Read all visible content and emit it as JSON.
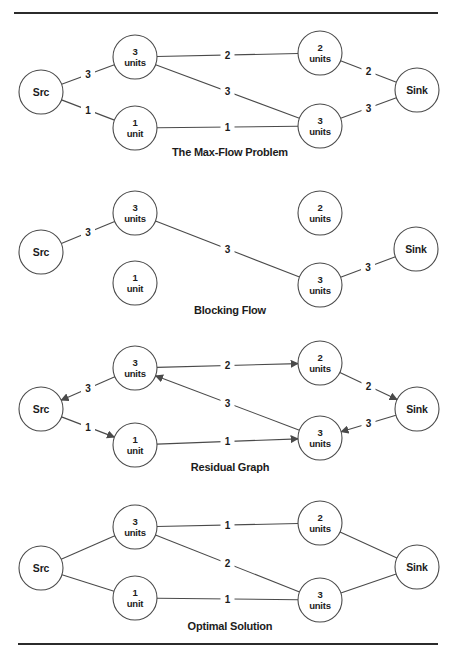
{
  "page": {
    "width": 458,
    "height": 661,
    "background": "#ffffff"
  },
  "style": {
    "node_radius": 22,
    "node_fill": "#ffffff",
    "node_stroke": "#4a4a4a",
    "edge_color": "#4a4a4a",
    "text_color": "#1c1c1c",
    "rule_color": "#2b2b2b"
  },
  "rules": [
    {
      "x1": 14,
      "x2": 438,
      "y": 13
    },
    {
      "x1": 18,
      "x2": 438,
      "y": 644
    }
  ],
  "diagrams": [
    {
      "id": "max-flow-problem",
      "caption": "The Max-Flow Problem",
      "caption_x": 230,
      "caption_y": 156,
      "nodes": [
        {
          "id": "src",
          "label": [
            "Src"
          ],
          "x": 41,
          "y": 92
        },
        {
          "id": "n3a",
          "label": [
            "3",
            "units"
          ],
          "x": 135,
          "y": 57
        },
        {
          "id": "n1",
          "label": [
            "1",
            "unit"
          ],
          "x": 135,
          "y": 128
        },
        {
          "id": "n2",
          "label": [
            "2",
            "units"
          ],
          "x": 320,
          "y": 53
        },
        {
          "id": "n3b",
          "label": [
            "3",
            "units"
          ],
          "x": 320,
          "y": 126
        },
        {
          "id": "sink",
          "label": [
            "Sink"
          ],
          "x": 417,
          "y": 90
        }
      ],
      "edges": [
        {
          "from": "src",
          "to": "n3a",
          "label": "3"
        },
        {
          "from": "src",
          "to": "n1",
          "label": "1"
        },
        {
          "from": "n3a",
          "to": "n2",
          "label": "2"
        },
        {
          "from": "n3a",
          "to": "n3b",
          "label": "3"
        },
        {
          "from": "n1",
          "to": "n3b",
          "label": "1"
        },
        {
          "from": "n2",
          "to": "sink",
          "label": "2"
        },
        {
          "from": "n3b",
          "to": "sink",
          "label": "3"
        }
      ]
    },
    {
      "id": "blocking-flow",
      "caption": "Blocking Flow",
      "caption_x": 230,
      "caption_y": 314,
      "nodes": [
        {
          "id": "src",
          "label": [
            "Src"
          ],
          "x": 41,
          "y": 252
        },
        {
          "id": "n3a",
          "label": [
            "3",
            "units"
          ],
          "x": 135,
          "y": 213
        },
        {
          "id": "n1",
          "label": [
            "1",
            "unit"
          ],
          "x": 135,
          "y": 283
        },
        {
          "id": "n2",
          "label": [
            "2",
            "units"
          ],
          "x": 320,
          "y": 213
        },
        {
          "id": "n3b",
          "label": [
            "3",
            "units"
          ],
          "x": 320,
          "y": 285
        },
        {
          "id": "sink",
          "label": [
            "Sink"
          ],
          "x": 416,
          "y": 249
        }
      ],
      "edges": [
        {
          "from": "src",
          "to": "n3a",
          "label": "3"
        },
        {
          "from": "n3a",
          "to": "n3b",
          "label": "3"
        },
        {
          "from": "n3b",
          "to": "sink",
          "label": "3"
        }
      ]
    },
    {
      "id": "residual-graph",
      "caption": "Residual Graph",
      "caption_x": 230,
      "caption_y": 471,
      "nodes": [
        {
          "id": "src",
          "label": [
            "Src"
          ],
          "x": 41,
          "y": 409
        },
        {
          "id": "n3a",
          "label": [
            "3",
            "units"
          ],
          "x": 135,
          "y": 368
        },
        {
          "id": "n1",
          "label": [
            "1",
            "unit"
          ],
          "x": 135,
          "y": 445
        },
        {
          "id": "n2",
          "label": [
            "2",
            "units"
          ],
          "x": 320,
          "y": 363
        },
        {
          "id": "n3b",
          "label": [
            "3",
            "units"
          ],
          "x": 320,
          "y": 438
        },
        {
          "id": "sink",
          "label": [
            "Sink"
          ],
          "x": 417,
          "y": 409
        }
      ],
      "edges": [
        {
          "from": "n3a",
          "to": "src",
          "label": "3",
          "directed": true
        },
        {
          "from": "src",
          "to": "n1",
          "label": "1",
          "directed": true
        },
        {
          "from": "n3a",
          "to": "n2",
          "label": "2",
          "directed": true
        },
        {
          "from": "n3b",
          "to": "n3a",
          "label": "3",
          "directed": true
        },
        {
          "from": "n1",
          "to": "n3b",
          "label": "1",
          "directed": true
        },
        {
          "from": "n2",
          "to": "sink",
          "label": "2",
          "directed": true
        },
        {
          "from": "sink",
          "to": "n3b",
          "label": "3",
          "directed": true
        }
      ]
    },
    {
      "id": "optimal-solution",
      "caption": "Optimal Solution",
      "caption_x": 230,
      "caption_y": 630,
      "nodes": [
        {
          "id": "src",
          "label": [
            "Src"
          ],
          "x": 41,
          "y": 568
        },
        {
          "id": "n3a",
          "label": [
            "3",
            "units"
          ],
          "x": 135,
          "y": 527
        },
        {
          "id": "n1",
          "label": [
            "1",
            "unit"
          ],
          "x": 135,
          "y": 598
        },
        {
          "id": "n2",
          "label": [
            "2",
            "units"
          ],
          "x": 320,
          "y": 523
        },
        {
          "id": "n3b",
          "label": [
            "3",
            "units"
          ],
          "x": 320,
          "y": 600
        },
        {
          "id": "sink",
          "label": [
            "Sink"
          ],
          "x": 417,
          "y": 567
        }
      ],
      "edges": [
        {
          "from": "src",
          "to": "n3a"
        },
        {
          "from": "src",
          "to": "n1"
        },
        {
          "from": "n3a",
          "to": "n2",
          "label": "1"
        },
        {
          "from": "n3a",
          "to": "n3b",
          "label": "2"
        },
        {
          "from": "n1",
          "to": "n3b",
          "label": "1"
        },
        {
          "from": "n2",
          "to": "sink"
        },
        {
          "from": "n3b",
          "to": "sink"
        }
      ]
    }
  ]
}
